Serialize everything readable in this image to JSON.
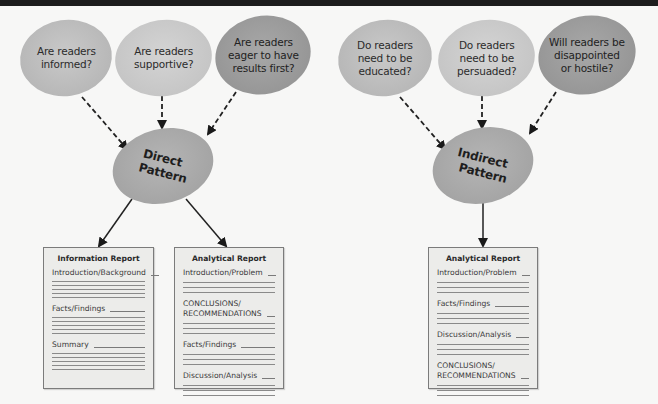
{
  "diagram": {
    "left": {
      "questions": [
        {
          "text": "Are readers\ninformed?"
        },
        {
          "text": "Are readers\nsupportive?"
        },
        {
          "text": "Are readers\neager to have\nresults first?"
        }
      ],
      "pattern": {
        "line1": "Direct",
        "line2": "Pattern"
      },
      "reports": [
        {
          "title": "Information Report",
          "sections": [
            {
              "label": "Introduction/Background",
              "rules": 5
            },
            {
              "label": "Facts/Findings",
              "rules": 5
            },
            {
              "label": "Summary",
              "rules": 5
            }
          ]
        },
        {
          "title": "Analytical Report",
          "sections": [
            {
              "label": "Introduction/Problem",
              "rules": 3
            },
            {
              "label": "CONCLUSIONS/\nRECOMMENDATIONS",
              "rules": 3
            },
            {
              "label": "Facts/Findings",
              "rules": 3
            },
            {
              "label": "Discussion/Analysis",
              "rules": 3
            }
          ]
        }
      ]
    },
    "right": {
      "questions": [
        {
          "text": "Do readers\nneed to be\neducated?"
        },
        {
          "text": "Do readers\nneed to be\npersuaded?"
        },
        {
          "text": "Will readers be\ndisappointed\nor hostile?"
        }
      ],
      "pattern": {
        "line1": "Indirect",
        "line2": "Pattern"
      },
      "reports": [
        {
          "title": "Analytical Report",
          "sections": [
            {
              "label": "Introduction/Problem",
              "rules": 3
            },
            {
              "label": "Facts/Findings",
              "rules": 3
            },
            {
              "label": "Discussion/Analysis",
              "rules": 3
            },
            {
              "label": "CONCLUSIONS/\nRECOMMENDATIONS",
              "rules": 3
            }
          ]
        }
      ]
    }
  }
}
